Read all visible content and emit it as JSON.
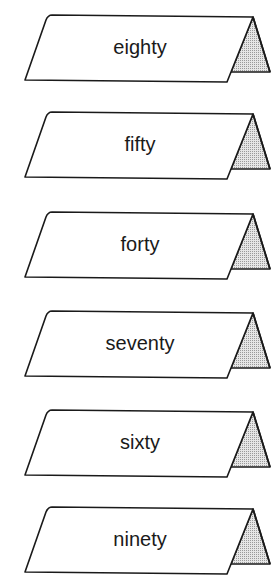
{
  "cards": [
    {
      "label": "eighty",
      "top": 0
    },
    {
      "label": "fifty",
      "top": 97
    },
    {
      "label": "forty",
      "top": 197
    },
    {
      "label": "seventy",
      "top": 296
    },
    {
      "label": "sixty",
      "top": 395
    },
    {
      "label": "ninety",
      "top": 492
    }
  ],
  "colors": {
    "stroke": "#1a1a1a",
    "face": "#ffffff",
    "side": "#cfcfcf"
  }
}
